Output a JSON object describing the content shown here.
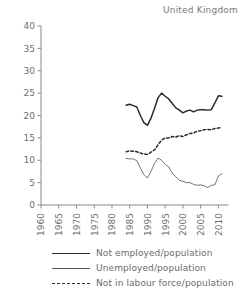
{
  "chart_data": {
    "type": "line",
    "title": "United Kingdom",
    "xlabel": "",
    "ylabel": "",
    "xlim": [
      1960,
      2012
    ],
    "ylim": [
      0,
      40
    ],
    "grid": false,
    "legend_position": "bottom",
    "yticks": [
      0,
      5,
      10,
      15,
      20,
      25,
      30,
      35,
      40
    ],
    "xticks": [
      1960,
      1965,
      1970,
      1975,
      1980,
      1985,
      1990,
      1995,
      2000,
      2005,
      2010
    ],
    "x": [
      1984,
      1985,
      1986,
      1987,
      1988,
      1989,
      1990,
      1991,
      1992,
      1993,
      1994,
      1995,
      1996,
      1997,
      1998,
      1999,
      2000,
      2001,
      2002,
      2003,
      2004,
      2005,
      2006,
      2007,
      2008,
      2009,
      2010,
      2011
    ],
    "series": [
      {
        "name": "Not employed/population",
        "style": "solid-thick",
        "color": "#2b2b2b",
        "values": [
          22.3,
          22.5,
          22.2,
          21.9,
          20.0,
          18.4,
          17.8,
          19.4,
          21.6,
          24.0,
          25.0,
          24.3,
          23.7,
          22.7,
          21.7,
          21.2,
          20.6,
          21.0,
          21.2,
          20.8,
          21.2,
          21.3,
          21.3,
          21.2,
          21.3,
          22.8,
          24.4,
          24.3
        ]
      },
      {
        "name": "Unemployed/population",
        "style": "solid-thin",
        "color": "#5a5a5a",
        "values": [
          10.4,
          10.3,
          10.3,
          9.9,
          8.3,
          6.8,
          6.0,
          7.5,
          9.3,
          10.5,
          10.0,
          9.1,
          8.5,
          7.1,
          6.3,
          5.5,
          5.3,
          5.0,
          5.0,
          4.6,
          4.4,
          4.5,
          4.3,
          3.9,
          4.4,
          4.5,
          6.5,
          7.0
        ]
      },
      {
        "name": "Not in labour force/population",
        "style": "dashed",
        "color": "#2b2b2b",
        "values": [
          11.9,
          12.1,
          12.0,
          11.9,
          11.6,
          11.4,
          11.3,
          11.8,
          12.3,
          13.5,
          14.5,
          15.0,
          15.0,
          15.3,
          15.2,
          15.5,
          15.3,
          15.7,
          16.0,
          16.1,
          16.5,
          16.6,
          16.8,
          16.9,
          16.8,
          17.1,
          17.2,
          17.3
        ]
      }
    ]
  }
}
